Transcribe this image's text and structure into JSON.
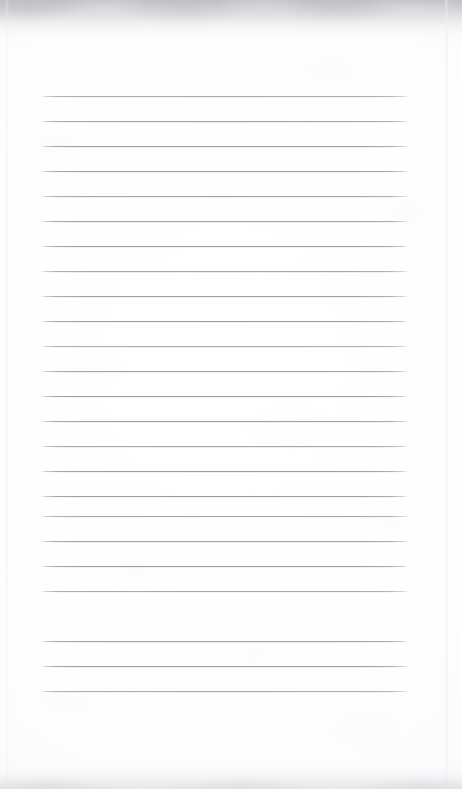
{
  "page": {
    "kind": "scanned-document",
    "width_px": 462,
    "height_px": 789,
    "background_color": "#ffffff",
    "paper_tone": "#fdfdfe",
    "text_content": [],
    "handwriting_present": false,
    "printed_text_present": false
  },
  "rules": {
    "count": 24,
    "color": "#9c9ca4",
    "thickness_px": 1,
    "left_x": 41,
    "right_x": 408,
    "first_y": 96,
    "spacing_y": 25,
    "y_positions": [
      96,
      121,
      146,
      171,
      196,
      221,
      246,
      271,
      296,
      321,
      346,
      371,
      396,
      421,
      446,
      471,
      496,
      516,
      541,
      566,
      591,
      641,
      666,
      691
    ]
  },
  "artifacts": {
    "top_shadow": {
      "name": "scanner-shadow-top",
      "start_y": 0,
      "end_y": 46,
      "peak_color": "#bcbcc0"
    },
    "bottom_shadow": {
      "name": "scanner-shadow-bottom",
      "start_y": 759,
      "end_y": 789,
      "peak_color": "#dedee2"
    },
    "vertical_streaks": [
      {
        "name": "scan-streak-left",
        "x": 6,
        "width": 4,
        "color": "#ececf0"
      },
      {
        "name": "scan-streak-right",
        "x": 445,
        "width": 5,
        "color": "#eeeef2"
      }
    ]
  }
}
